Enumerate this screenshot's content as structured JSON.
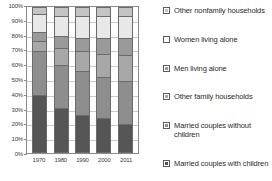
{
  "chart_data": {
    "type": "bar",
    "subtype": "stacked-percentage",
    "title": "",
    "xlabel": "",
    "ylabel": "",
    "categories": [
      "1970",
      "1980",
      "1990",
      "2000",
      "2011"
    ],
    "ylim": [
      0,
      100
    ],
    "ytick_labels": [
      "0%",
      "10%",
      "20%",
      "30%",
      "40%",
      "50%",
      "60%",
      "70%",
      "80%",
      "90%",
      "100%"
    ],
    "ytick_values": [
      0,
      10,
      20,
      30,
      40,
      50,
      60,
      70,
      80,
      90,
      100
    ],
    "grid": true,
    "legend_position": "right",
    "stack_order_bottom_to_top": [
      "Married couples with children",
      "Married couples without children",
      "Other family households",
      "Men living alone",
      "Women living alone",
      "Other nonfamily households"
    ],
    "series": [
      {
        "name": "Married couples with children",
        "color": "#555555",
        "values": [
          40,
          31,
          26,
          24,
          20
        ]
      },
      {
        "name": "Married couples without children",
        "color": "#8e8e8e",
        "values": [
          30,
          29,
          30,
          28,
          29
        ]
      },
      {
        "name": "Other family households",
        "color": "#a8a8a8",
        "values": [
          7,
          12,
          14,
          16,
          18
        ]
      },
      {
        "name": "Men living alone",
        "color": "#9a9a9a",
        "values": [
          6,
          8,
          9,
          11,
          12
        ]
      },
      {
        "name": "Women living alone",
        "color": "#e8e8e8",
        "values": [
          12,
          14,
          15,
          15,
          15
        ]
      },
      {
        "name": "Other nonfamily households",
        "color": "#c4c4c4",
        "values": [
          5,
          6,
          6,
          6,
          6
        ]
      }
    ]
  },
  "legend": {
    "items": [
      {
        "label": "Other nonfamily households",
        "color": "#c4c4c4"
      },
      {
        "label": "Women living alone",
        "color": "#ffffff"
      },
      {
        "label": "Men living alone",
        "color": "#9a9a9a"
      },
      {
        "label": "Other family households",
        "color": "#a8a8a8"
      },
      {
        "label": "Married couples without children",
        "color": "#8e8e8e"
      },
      {
        "label": "Married couples with children",
        "color": "#555555"
      }
    ]
  }
}
